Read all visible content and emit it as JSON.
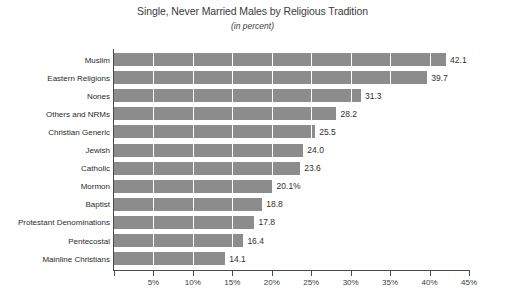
{
  "chart_data": {
    "type": "bar",
    "orientation": "horizontal",
    "title": "Single, Never Married Males by Religious Tradition",
    "subtitle": "(in percent)",
    "xlabel": "",
    "ylabel": "",
    "xlim": [
      0,
      45
    ],
    "grid": true,
    "grid_axis": "x",
    "legend": "none",
    "bar_color": "#8c8c8c",
    "gridline_color": "#ffffff",
    "axis_color": "#4a4a4a",
    "categories": [
      "Muslim",
      "Eastern Religions",
      "Nones",
      "Others and NRMs",
      "Christian Generic",
      "Jewish",
      "Catholic",
      "Mormon",
      "Baptist",
      "Protestant Denominations",
      "Pentecostal",
      "Mainline Christians"
    ],
    "values": [
      42.1,
      39.7,
      31.3,
      28.2,
      25.5,
      24.0,
      23.6,
      20.1,
      18.8,
      17.8,
      16.4,
      14.1
    ],
    "value_labels": [
      "42.1",
      "39.7",
      "31.3",
      "28.2",
      "25.5",
      "24.0",
      "23.6",
      "20.1%",
      "18.8",
      "17.8",
      "16.4",
      "14.1"
    ],
    "xticks": [
      0,
      5,
      10,
      15,
      20,
      25,
      30,
      35,
      40,
      45
    ],
    "xticklabels": [
      "",
      "5%",
      "10%",
      "15%",
      "20%",
      "25%",
      "30%",
      "35%",
      "40%",
      "45%"
    ]
  }
}
